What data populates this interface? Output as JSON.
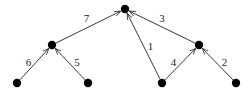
{
  "diagram": {
    "type": "directed-tree",
    "nodes": [
      {
        "id": "root"
      },
      {
        "id": "left-mid"
      },
      {
        "id": "right-mid"
      },
      {
        "id": "leaf-1"
      },
      {
        "id": "leaf-2"
      },
      {
        "id": "leaf-3"
      },
      {
        "id": "leaf-4"
      }
    ],
    "edges": [
      {
        "from": "left-mid",
        "to": "root",
        "label": "7"
      },
      {
        "from": "right-mid",
        "to": "root",
        "label": "3"
      },
      {
        "from": "leaf-3",
        "to": "root",
        "label": "1"
      },
      {
        "from": "leaf-1",
        "to": "left-mid",
        "label": "6"
      },
      {
        "from": "leaf-2",
        "to": "left-mid",
        "label": "5"
      },
      {
        "from": "leaf-3",
        "to": "right-mid",
        "label": "4"
      },
      {
        "from": "leaf-4",
        "to": "right-mid",
        "label": "2"
      }
    ]
  }
}
